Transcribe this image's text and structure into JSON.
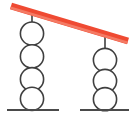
{
  "figure": {
    "width": 133,
    "height": 118,
    "background_color": "#ffffff"
  },
  "colors": {
    "beam": "#ef4a32",
    "beam_highlight": "#f47a64",
    "outline": "#3f3f3f",
    "ground": "#4a4a4a",
    "circle_fill": "#ffffff"
  },
  "beam": {
    "label": "red-beam",
    "x1": 11,
    "y1": 6,
    "x2": 128,
    "y2": 41,
    "thickness": 7,
    "color": "#ef4a32"
  },
  "supports": [
    {
      "label": "left-support",
      "center_x": 32,
      "circle_count": 4,
      "circle_radius": 11.6,
      "circle_centers_y": [
        33.6,
        56.4,
        79.2,
        98.8
      ],
      "stem": {
        "x": 32,
        "y_top": 10,
        "y_bottom": 22
      },
      "ground": {
        "y": 110,
        "x_start": 7,
        "x_end": 59
      }
    },
    {
      "label": "right-support",
      "center_x": 105,
      "circle_count": 3,
      "circle_radius": 11.6,
      "circle_centers_y": [
        60.0,
        81.0,
        99.2
      ],
      "stem": {
        "x": 105,
        "y_top": 36,
        "y_bottom": 48
      },
      "ground": {
        "y": 110,
        "x_start": 80,
        "x_end": 129
      }
    }
  ],
  "chart_data": {
    "type": "diagram",
    "elements": [
      {
        "name": "beam",
        "kind": "thick-line",
        "color": "#ef4a32",
        "from": [
          11,
          6
        ],
        "to": [
          128,
          41
        ]
      },
      {
        "name": "left-stack",
        "kind": "circle-stack",
        "count": 4,
        "center_x": 32,
        "radius": 11.6
      },
      {
        "name": "right-stack",
        "kind": "circle-stack",
        "count": 3,
        "center_x": 105,
        "radius": 11.6
      },
      {
        "name": "left-ground-line",
        "kind": "line",
        "y": 110,
        "from_x": 7,
        "to_x": 59
      },
      {
        "name": "right-ground-line",
        "kind": "line",
        "y": 110,
        "from_x": 80,
        "to_x": 129
      }
    ],
    "counts": {
      "left_circles": 4,
      "right_circles": 3,
      "total_circles": 7
    }
  }
}
